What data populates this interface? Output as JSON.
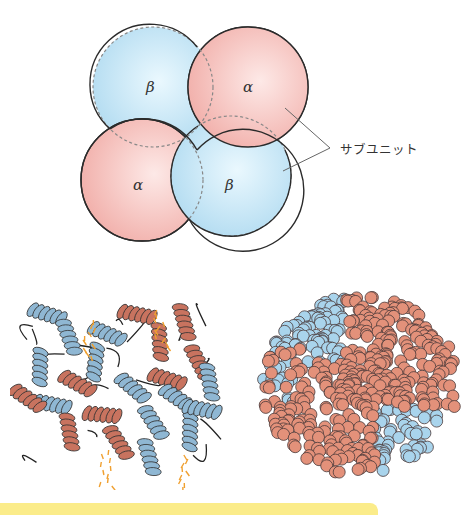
{
  "figure": {
    "subunits": [
      {
        "id": "top-left",
        "greek": "β",
        "type": "beta"
      },
      {
        "id": "top-right",
        "greek": "α",
        "type": "alpha"
      },
      {
        "id": "bottom-left",
        "greek": "α",
        "type": "alpha"
      },
      {
        "id": "bottom-right",
        "greek": "β",
        "type": "beta"
      }
    ],
    "callout_label": "サブユニット",
    "colors": {
      "alpha_fill": "#f4b8b4",
      "alpha_center": "#fde6e4",
      "beta_fill": "#b9dff2",
      "beta_center": "#e6f6fd",
      "outline": "#2b2b2b",
      "ribbon_alpha": "#c8735f",
      "ribbon_beta": "#8fb7d3",
      "heme": "#f0a030",
      "sphere_alpha": "#e3917a",
      "sphere_beta": "#a9d4ec",
      "band": "#fbec8a"
    },
    "models": [
      {
        "id": "ribbon-model",
        "description": "ribbon diagram"
      },
      {
        "id": "space-filling-model",
        "description": "space-filling diagram"
      }
    ]
  }
}
